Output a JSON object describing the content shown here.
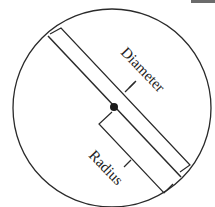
{
  "diagram": {
    "labels": {
      "diameter": "Diameter",
      "radius": "Radius"
    },
    "colors": {
      "stroke": "#2a2a2a",
      "center_dot": "#1a1a1a",
      "background": "#ffffff",
      "corner_bar": "#6b6b6b"
    }
  }
}
